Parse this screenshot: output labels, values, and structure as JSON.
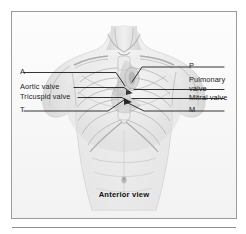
{
  "figure": {
    "caption": "Anterior view",
    "alt_title": "Cardiac auscultation points on anterior chest",
    "frame_border_color": "#9a9a9a",
    "rule_color": "#8f8f8f",
    "ink_color": "#1c1c1c",
    "illustration": {
      "subject": "human torso anterior view",
      "style": "grayscale pencil shaded medical illustration",
      "features": [
        "neck",
        "clavicles",
        "shoulders",
        "sternum",
        "ribcage",
        "abdomen",
        "navel"
      ]
    }
  },
  "labels_left": [
    {
      "id": "a-point",
      "text": "A"
    },
    {
      "id": "aortic-valve",
      "text": "Aortic valve"
    },
    {
      "id": "tricuspid-valve",
      "text": "Tricuspid valve"
    },
    {
      "id": "t-point",
      "text": "T"
    }
  ],
  "labels_right": [
    {
      "id": "p-point",
      "text": "P"
    },
    {
      "id": "pulmonary-valve",
      "text": "Pulmonary",
      "text2": "valve"
    },
    {
      "id": "mitral-valve",
      "text": "Mitral valve"
    },
    {
      "id": "m-point",
      "text": "M"
    }
  ]
}
